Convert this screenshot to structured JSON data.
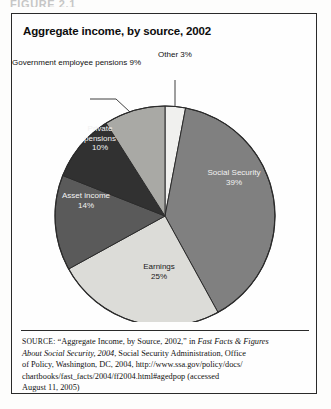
{
  "figure": {
    "header_label": "FIGURE 2.1",
    "title": "Aggregate income, by source, 2002"
  },
  "chart_data": {
    "type": "pie",
    "title": "Aggregate income, by source, 2002",
    "xlabel": "",
    "ylabel": "",
    "legend_position": "none",
    "grid": false,
    "units": "percent",
    "categories": [
      "Other",
      "Social Security",
      "Earnings",
      "Asset income",
      "Private pensions",
      "Government employee pensions"
    ],
    "values": [
      3,
      39,
      25,
      14,
      10,
      9
    ],
    "slices": [
      {
        "name": "Other",
        "label": "Other",
        "value": 3,
        "value_text": "3%",
        "color": "#f0f0ee",
        "label_style": "callout",
        "label_text_color": "#111111"
      },
      {
        "name": "Social Security",
        "label": "Social Security",
        "value": 39,
        "value_text": "39%",
        "color": "#808080",
        "label_style": "inside",
        "label_text_color": "#f2f2f2"
      },
      {
        "name": "Earnings",
        "label": "Earnings",
        "value": 25,
        "value_text": "25%",
        "color": "#dcdcd8",
        "label_style": "inside",
        "label_text_color": "#1a1a1a"
      },
      {
        "name": "Asset income",
        "label": "Asset income",
        "value": 14,
        "value_text": "14%",
        "color": "#5a5a5a",
        "label_style": "inside",
        "label_text_color": "#f2f2f2"
      },
      {
        "name": "Private pensions",
        "label": "Private pensions",
        "value": 10,
        "value_text": "10%",
        "color": "#313131",
        "label_style": "inside",
        "label_text_color": "#f2f2f2"
      },
      {
        "name": "Government employee pensions",
        "label": "Government employee pensions",
        "value": 9,
        "value_text": "9%",
        "color": "#a9a9a5",
        "label_style": "callout",
        "label_text_color": "#111111"
      }
    ],
    "labels": {
      "social_security_name": "Social Security",
      "social_security_pct": "39%",
      "earnings_name": "Earnings",
      "earnings_pct": "25%",
      "asset_income_name": "Asset income",
      "asset_income_pct": "14%",
      "private_pensions_name_1": "Private",
      "private_pensions_name_2": "pensions",
      "private_pensions_pct": "10%",
      "gov_pensions_name_1": "Government",
      "gov_pensions_name_2": "employee pensions",
      "gov_pensions_pct": "9%",
      "other_name": "Other",
      "other_pct": "3%"
    }
  },
  "source": {
    "tag": "SOURCE:",
    "line1_pre": " “Aggregate Income, by Source, 2002,” in ",
    "line1_italic": "Fast Facts & Figures",
    "line2_italic": "About Social Security, 2004",
    "line2_post": ", Social Security Administration, Office",
    "line3": "of Policy, Washington, DC, 2004, http://www.ssa.gov/policy/docs/",
    "line4": "chartbooks/fast_facts/2004/ff2004.html#agedpop (accessed",
    "line5": "August 11, 2005)"
  }
}
